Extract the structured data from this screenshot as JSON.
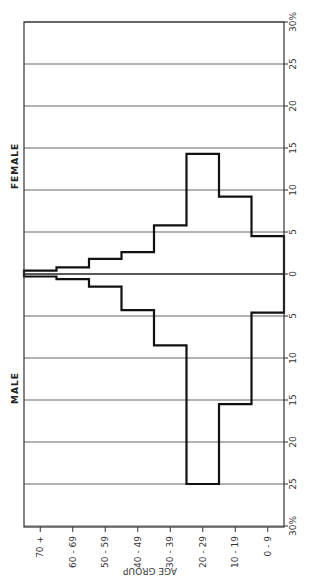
{
  "chart_data": {
    "type": "bar",
    "subtype": "population-pyramid (rotated 90°, step outline)",
    "title": "",
    "xlabel": "AGE GROUP",
    "ylabel": "%",
    "categories": [
      "70+",
      "60-69",
      "50-59",
      "40-49",
      "30-39",
      "20-29",
      "10-19",
      "0-9"
    ],
    "category_tick_labels": [
      "70 +",
      "60 - 69",
      "50 - 59",
      "40 - 49",
      "30 - 39",
      "20 - 29",
      "10 - 19",
      "0 - 9"
    ],
    "series": [
      {
        "name": "FEMALE",
        "values": [
          0.4,
          0.8,
          1.8,
          2.6,
          5.8,
          14.3,
          9.2,
          4.5
        ]
      },
      {
        "name": "MALE",
        "values": [
          0.3,
          0.6,
          1.5,
          4.3,
          8.5,
          25.0,
          15.5,
          4.6
        ]
      }
    ],
    "value_axis": {
      "range": [
        -30,
        30
      ],
      "ticks_female": [
        "0",
        "5",
        "10",
        "15",
        "20",
        "25",
        "30%"
      ],
      "ticks_male": [
        "5",
        "10",
        "15",
        "20",
        "25",
        "30%"
      ],
      "grid": true,
      "grid_step": 5
    },
    "legend": {
      "female_label": "FEMALE",
      "male_label": "MALE",
      "position": "left side labels"
    }
  },
  "labels": {
    "female": "FEMALE",
    "male": "MALE",
    "age_axis_title": "AGE GROUP"
  }
}
